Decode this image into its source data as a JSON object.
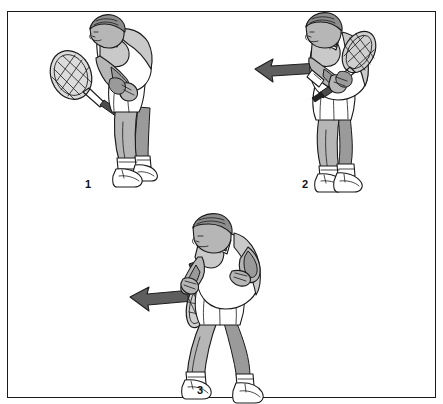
{
  "figure": {
    "kind": "instructional-illustration",
    "border_color": "#1b1b1b",
    "background_color": "#ffffff",
    "panels": [
      {
        "number": "1",
        "label_x": 84,
        "label_y": 167,
        "caption": "ready position, racket held in front with both hands, knees bent, body leaning forward",
        "has_arrow": false,
        "arrow_direction": ""
      },
      {
        "number": "2",
        "label_x": 294,
        "label_y": 167,
        "caption": "turn and take back, racket drawn across body to the shoulder, weight loaded",
        "has_arrow": true,
        "arrow_direction": "left"
      },
      {
        "number": "3",
        "label_x": 189,
        "label_y": 373,
        "caption": "follow through, racket arm extended low across the body toward the target",
        "has_arrow": true,
        "arrow_direction": "left"
      }
    ]
  },
  "palette": {
    "outline": "#1a1a1a",
    "skin": "#b6b6b6",
    "skin_shadow": "#9a9a9a",
    "hair": "#8d8d8d",
    "shirt": "#ffffff",
    "shirt_shade": "#c9c9c9",
    "shorts": "#ffffff",
    "shoe": "#f2f2f2",
    "arrow_fill": "#5e5e5e",
    "racket_face": "#dcdcdc",
    "grip": "#3b3b3b"
  },
  "icons": {
    "arrow_left": "arrow-left-icon",
    "racket": "tennis-racket-icon"
  }
}
